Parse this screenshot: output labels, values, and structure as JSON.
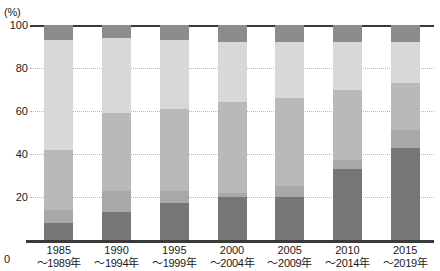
{
  "chart_data": {
    "type": "bar",
    "subtype": "100% stacked column",
    "title": "",
    "xlabel": "",
    "ylabel": "",
    "yunit": "(%)",
    "ylim": [
      0,
      100
    ],
    "yticks": [
      0,
      20,
      40,
      60,
      80,
      100
    ],
    "ytick_labels": [
      "0",
      "20",
      "40",
      "60",
      "80",
      "100"
    ],
    "grid": "horizontal dotted gridlines at 20, 40, 60, 80",
    "legend": "none",
    "categories": [
      "1985\n～1989年",
      "1990\n～1994年",
      "1995\n～1999年",
      "2000\n～2004年",
      "2005\n～2009年",
      "2010\n～2014年",
      "2015\n～2019年"
    ],
    "category_lines": [
      {
        "line1": "1985",
        "line2": "～1989年"
      },
      {
        "line1": "1990",
        "line2": "～1994年"
      },
      {
        "line1": "1995",
        "line2": "～1999年"
      },
      {
        "line1": "2000",
        "line2": "～2004年"
      },
      {
        "line1": "2005",
        "line2": "～2009年"
      },
      {
        "line1": "2010",
        "line2": "～2014年"
      },
      {
        "line1": "2015",
        "line2": "～2019年"
      }
    ],
    "series": [
      {
        "name": "segment-1",
        "color": "#767676",
        "stack_order": 1,
        "values": [
          8,
          13,
          17,
          20,
          20,
          33,
          43
        ]
      },
      {
        "name": "segment-2",
        "color": "#a8a8a8",
        "stack_order": 2,
        "values": [
          6,
          10,
          6,
          2,
          5,
          4,
          8
        ]
      },
      {
        "name": "segment-3",
        "color": "#b9b9b9",
        "stack_order": 3,
        "values": [
          28,
          36,
          38,
          42,
          41,
          33,
          22
        ]
      },
      {
        "name": "segment-4",
        "color": "#d8d8d8",
        "stack_order": 4,
        "values": [
          51,
          35,
          32,
          28,
          26,
          22,
          19
        ]
      },
      {
        "name": "segment-5",
        "color": "#8c8c8c",
        "stack_order": 5,
        "values": [
          7,
          6,
          7,
          8,
          8,
          8,
          8
        ]
      }
    ]
  },
  "axis": {
    "unit_label": "(%)",
    "zero_label": "0"
  },
  "colors": {
    "axis_line": "#3a3a3a",
    "gridline": "#b9b9b9",
    "background": "#ffffff",
    "text": "#1a1a1a"
  }
}
